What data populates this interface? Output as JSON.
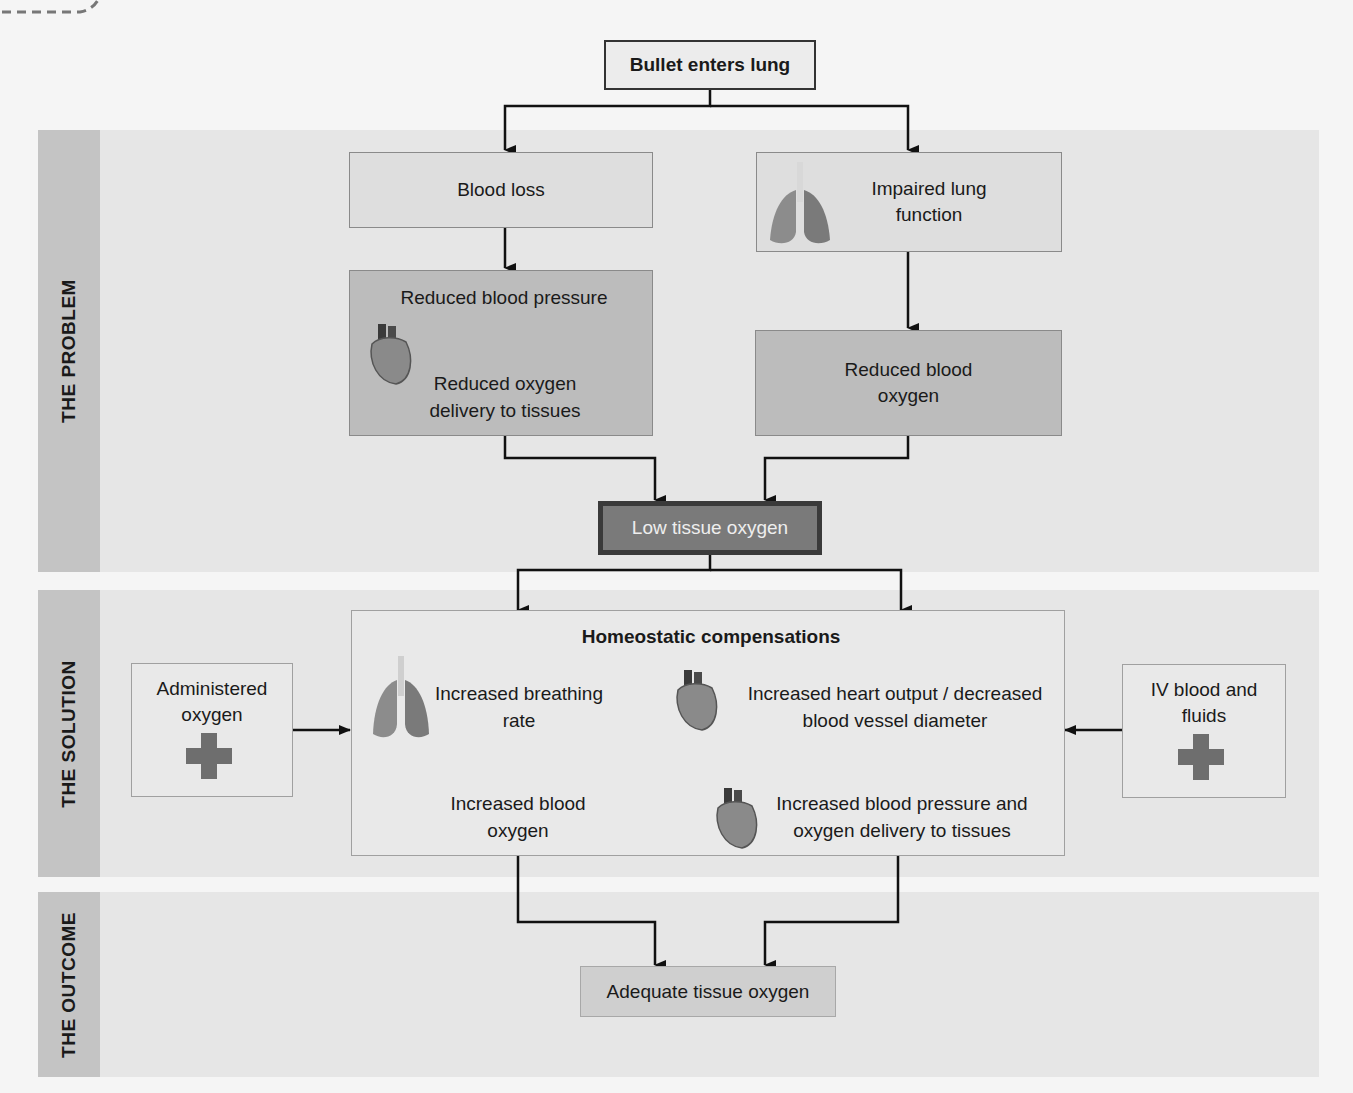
{
  "sections": {
    "problem": "THE PROBLEM",
    "solution": "THE SOLUTION",
    "outcome": "THE OUTCOME"
  },
  "nodes": {
    "start": "Bullet enters lung",
    "blood_loss": "Blood loss",
    "impaired_lung": "Impaired lung function",
    "reduced_bp": "Reduced blood pressure",
    "reduced_o2_delivery": "Reduced oxygen delivery to tissues",
    "reduced_blood_o2": "Reduced blood oxygen",
    "low_tissue_o2": "Low tissue oxygen",
    "homeostatic_title": "Homeostatic compensations",
    "increased_breathing": "Increased breathing rate",
    "increased_blood_o2": "Increased blood oxygen",
    "increased_heart_output": "Increased heart output / decreased blood vessel diameter",
    "increased_bp_delivery": "Increased blood pressure and oxygen delivery to tissues",
    "administered_o2": "Administered oxygen",
    "iv_blood": "IV blood and fluids",
    "adequate_o2": "Adequate tissue oxygen"
  },
  "icons": [
    "heart-icon",
    "lungs-icon",
    "medical-cross-icon"
  ],
  "colors": {
    "band": "#e6e6e6",
    "band_label": "#c4c4c4",
    "box_dark": "#bcbcbc",
    "low_box": "#7a7a7a",
    "cross": "#6e6e6e"
  }
}
